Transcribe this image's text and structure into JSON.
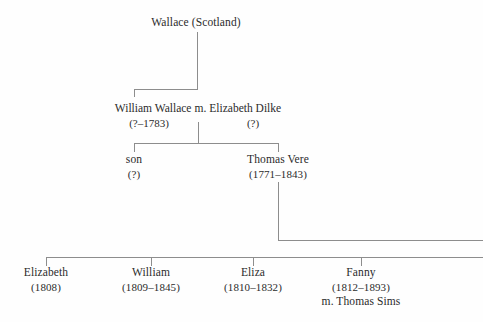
{
  "diagram": {
    "title_text": "Wallace family tree",
    "generations": [
      {
        "id": "gen1",
        "nodes": [
          {
            "name": "Wallace (Scotland)",
            "dates": "",
            "spouse": ""
          }
        ]
      },
      {
        "id": "gen2",
        "nodes": [
          {
            "name": "William Wallace",
            "dates": "(?–1783)",
            "marriage_label": "m.",
            "spouse_name": "Elizabeth Dilke",
            "spouse_dates": "(?)"
          }
        ]
      },
      {
        "id": "gen3",
        "nodes": [
          {
            "name": "son",
            "dates": "(?)",
            "spouse": ""
          },
          {
            "name": "Thomas Vere",
            "dates": "(1771–1843)",
            "spouse": ""
          }
        ]
      },
      {
        "id": "gen4",
        "nodes": [
          {
            "name": "Elizabeth",
            "dates": "(1808)",
            "spouse": ""
          },
          {
            "name": "William",
            "dates": "(1809–1845)",
            "spouse": ""
          },
          {
            "name": "Eliza",
            "dates": "(1810–1832)",
            "spouse": ""
          },
          {
            "name": "Fanny",
            "dates": "(1812–1893)",
            "spouse": "m. Thomas Sims"
          }
        ]
      }
    ],
    "colors": {
      "line": "#8d8d8d",
      "text": "#2b2b2b",
      "background": "#fefefe"
    }
  }
}
